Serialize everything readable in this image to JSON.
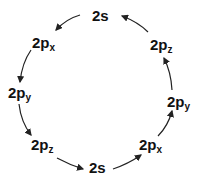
{
  "diagram": {
    "type": "cycle",
    "nodes": [
      {
        "id": "top_2s",
        "main": "2s",
        "sub": ""
      },
      {
        "id": "left_2px",
        "main": "2p",
        "sub": "x"
      },
      {
        "id": "left_2py",
        "main": "2p",
        "sub": "y"
      },
      {
        "id": "left_2pz",
        "main": "2p",
        "sub": "z"
      },
      {
        "id": "bottom_2s",
        "main": "2s",
        "sub": ""
      },
      {
        "id": "right_2px",
        "main": "2p",
        "sub": "x"
      },
      {
        "id": "right_2py",
        "main": "2p",
        "sub": "y"
      },
      {
        "id": "right_2pz",
        "main": "2p",
        "sub": "z"
      }
    ],
    "arrow_color": "#222222",
    "direction": "counterclockwise"
  }
}
